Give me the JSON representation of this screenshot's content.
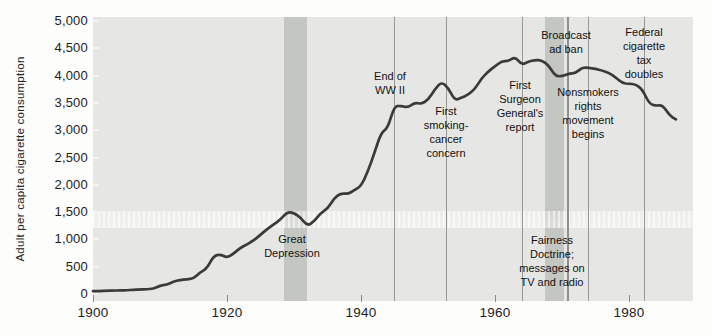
{
  "chart_data": {
    "type": "line",
    "title": "",
    "xlabel": "",
    "ylabel": "Adult per capita cigarette consumption",
    "xlim": [
      1900,
      1989.5
    ],
    "ylim": [
      0,
      5000
    ],
    "grid": false,
    "legend": "none",
    "x_ticks": [
      {
        "v": 1900,
        "label": "1900"
      },
      {
        "v": 1920,
        "label": "1920"
      },
      {
        "v": 1940,
        "label": "1940"
      },
      {
        "v": 1960,
        "label": "1960"
      },
      {
        "v": 1980,
        "label": "1980"
      }
    ],
    "y_ticks": [
      {
        "v": 0,
        "label": "0"
      },
      {
        "v": 500,
        "label": "500"
      },
      {
        "v": 1000,
        "label": "1,000"
      },
      {
        "v": 1500,
        "label": "1,500"
      },
      {
        "v": 2000,
        "label": "2,000"
      },
      {
        "v": 2500,
        "label": "2,500"
      },
      {
        "v": 3000,
        "label": "3,000"
      },
      {
        "v": 3500,
        "label": "3,500"
      },
      {
        "v": 4000,
        "label": "4,000"
      },
      {
        "v": 4500,
        "label": "4,500"
      },
      {
        "v": 5000,
        "label": "5,000"
      }
    ],
    "series": [
      {
        "name": "Adult per capita cigarette consumption",
        "points": [
          [
            1900,
            54
          ],
          [
            1901,
            53
          ],
          [
            1902,
            60
          ],
          [
            1903,
            64
          ],
          [
            1904,
            66
          ],
          [
            1905,
            70
          ],
          [
            1906,
            75
          ],
          [
            1907,
            86
          ],
          [
            1908,
            86
          ],
          [
            1909,
            97
          ],
          [
            1910,
            151
          ],
          [
            1911,
            173
          ],
          [
            1912,
            223
          ],
          [
            1913,
            260
          ],
          [
            1914,
            267
          ],
          [
            1915,
            285
          ],
          [
            1916,
            395
          ],
          [
            1917,
            470
          ],
          [
            1918,
            697
          ],
          [
            1919,
            727
          ],
          [
            1920,
            665
          ],
          [
            1921,
            742
          ],
          [
            1922,
            847
          ],
          [
            1923,
            911
          ],
          [
            1924,
            982
          ],
          [
            1925,
            1085
          ],
          [
            1926,
            1191
          ],
          [
            1927,
            1279
          ],
          [
            1928,
            1366
          ],
          [
            1929,
            1504
          ],
          [
            1930,
            1485
          ],
          [
            1931,
            1399
          ],
          [
            1932,
            1245
          ],
          [
            1933,
            1334
          ],
          [
            1934,
            1483
          ],
          [
            1935,
            1564
          ],
          [
            1936,
            1754
          ],
          [
            1937,
            1847
          ],
          [
            1938,
            1830
          ],
          [
            1939,
            1900
          ],
          [
            1940,
            1976
          ],
          [
            1941,
            2236
          ],
          [
            1942,
            2585
          ],
          [
            1943,
            2956
          ],
          [
            1944,
            3039
          ],
          [
            1945,
            3449
          ],
          [
            1946,
            3446
          ],
          [
            1947,
            3416
          ],
          [
            1948,
            3505
          ],
          [
            1949,
            3480
          ],
          [
            1950,
            3552
          ],
          [
            1951,
            3744
          ],
          [
            1952,
            3886
          ],
          [
            1953,
            3778
          ],
          [
            1954,
            3546
          ],
          [
            1955,
            3597
          ],
          [
            1956,
            3650
          ],
          [
            1957,
            3755
          ],
          [
            1958,
            3953
          ],
          [
            1959,
            4073
          ],
          [
            1960,
            4171
          ],
          [
            1961,
            4266
          ],
          [
            1962,
            4266
          ],
          [
            1963,
            4345
          ],
          [
            1964,
            4194
          ],
          [
            1965,
            4258
          ],
          [
            1966,
            4287
          ],
          [
            1967,
            4280
          ],
          [
            1968,
            4186
          ],
          [
            1969,
            3993
          ],
          [
            1970,
            3985
          ],
          [
            1971,
            4037
          ],
          [
            1972,
            4043
          ],
          [
            1973,
            4148
          ],
          [
            1974,
            4141
          ],
          [
            1975,
            4122
          ],
          [
            1976,
            4092
          ],
          [
            1977,
            4051
          ],
          [
            1978,
            3967
          ],
          [
            1979,
            3861
          ],
          [
            1980,
            3851
          ],
          [
            1981,
            3840
          ],
          [
            1982,
            3746
          ],
          [
            1983,
            3488
          ],
          [
            1984,
            3446
          ],
          [
            1985,
            3461
          ],
          [
            1986,
            3274
          ],
          [
            1987,
            3197
          ]
        ]
      }
    ],
    "bands": [
      {
        "id": "great-depression-band",
        "label": "Great Depression",
        "from": 1928.5,
        "to": 1931.9
      },
      {
        "id": "fairness-doctrine-band",
        "label": "Fairness Doctrine; messages on TV and radio",
        "from": 1967.5,
        "to": 1970.3
      }
    ],
    "event_lines": [
      {
        "id": "end-of-wwii-line",
        "label": "End of WW II",
        "year": 1944.9,
        "thick": false
      },
      {
        "id": "smoking-cancer-concern-line",
        "label": "First smoking-cancer concern",
        "year": 1952.7,
        "thick": false
      },
      {
        "id": "surgeon-general-report-line",
        "label": "First Surgeon General's report",
        "year": 1964.0,
        "thick": false
      },
      {
        "id": "broadcast-ad-ban-line",
        "label": "Broadcast ad ban",
        "year": 1970.7,
        "thick": true
      },
      {
        "id": "nonsmokers-rights-line",
        "label": "Nonsmokers rights movement begins",
        "year": 1973.8,
        "thick": false
      },
      {
        "id": "cigarette-tax-doubles-line",
        "label": "Federal cigarette tax doubles",
        "year": 1982.2,
        "thick": false
      }
    ],
    "annotations": [
      {
        "id": "great-depression-label",
        "lines": [
          "Great",
          "Depression"
        ],
        "x": 292,
        "top": 232
      },
      {
        "id": "end-of-wwii-label",
        "lines": [
          "End of",
          "WW II"
        ],
        "x": 390,
        "top": 69
      },
      {
        "id": "smoking-cancer-concern-label",
        "lines": [
          "First",
          "smoking-",
          "cancer",
          "concern"
        ],
        "x": 446,
        "top": 104
      },
      {
        "id": "surgeon-general-report-label",
        "lines": [
          "First",
          "Surgeon",
          "General's",
          "report"
        ],
        "x": 520,
        "top": 78
      },
      {
        "id": "broadcast-ad-ban-label",
        "lines": [
          "Broadcast",
          "ad ban"
        ],
        "x": 566,
        "top": 28
      },
      {
        "id": "nonsmokers-rights-label",
        "lines": [
          "Nonsmokers",
          "rights",
          "movement",
          "begins"
        ],
        "x": 588,
        "top": 85
      },
      {
        "id": "fairness-doctrine-label",
        "lines": [
          "Fairness",
          "Doctrine;",
          "messages on",
          "TV and radio"
        ],
        "x": 552,
        "top": 233
      },
      {
        "id": "cigarette-tax-doubles-label",
        "lines": [
          "Federal",
          "cigarette",
          "tax",
          "doubles"
        ],
        "x": 644,
        "top": 25
      }
    ],
    "colors": {
      "plot_bg": "#e6e6e4",
      "band": "#c3c6c1",
      "curve": "#3a3a38",
      "event_line": "#979797",
      "text": "#1a1a1a"
    }
  }
}
